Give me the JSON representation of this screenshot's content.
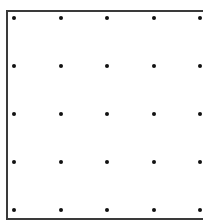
{
  "diagram": {
    "type": "dot-grid",
    "rows": 5,
    "columns": 5,
    "dot_color": "#111111",
    "border_color": "#3a3a3a",
    "column_positions_px": [
      14,
      61,
      107,
      154,
      200
    ],
    "row_positions_px": [
      18,
      66,
      114,
      162,
      210
    ],
    "frame_sides_visible": [
      "left",
      "top",
      "bottom"
    ]
  }
}
